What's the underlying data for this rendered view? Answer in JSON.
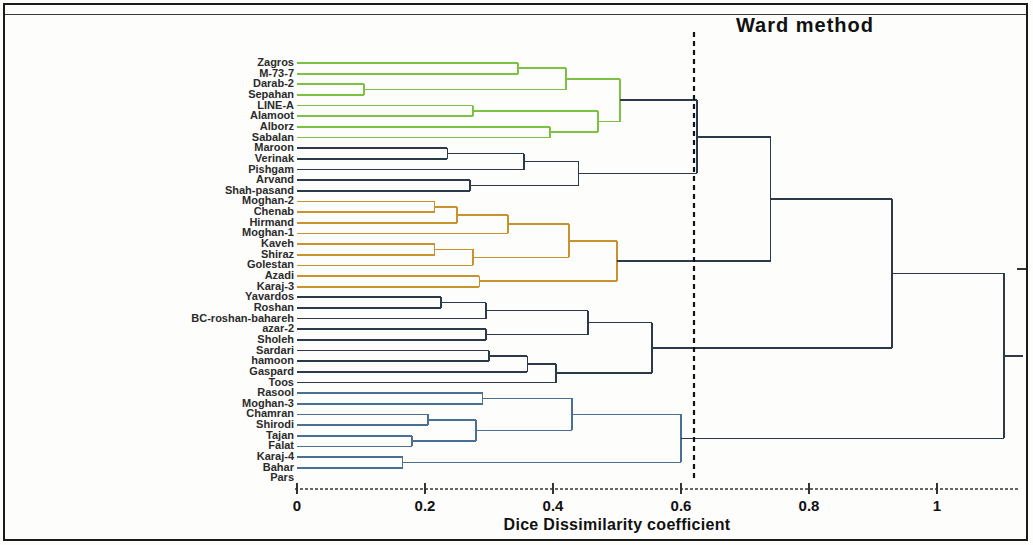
{
  "chart_data": {
    "type": "dendrogram",
    "title": "Ward method",
    "xlabel": "Dice Dissimilarity coefficient",
    "ylabel": "",
    "xlim": [
      0,
      1.15
    ],
    "xticks": [
      0,
      0.2,
      0.4,
      0.6,
      0.8,
      1
    ],
    "xtick_labels": [
      "0",
      "0.2",
      "0.4",
      "0.6",
      "0.8",
      "1"
    ],
    "grid": false,
    "legend": "none",
    "cut_line": {
      "value": 0.615,
      "style": "dashed",
      "color": "#111111"
    },
    "leaf_order": [
      "Zagros",
      "M-73-7",
      "Darab-2",
      "Sepahan",
      "LINE-A",
      "Alamoot",
      "Alborz",
      "Sabalan",
      "Maroon",
      "Verinak",
      "Pishgam",
      "Arvand",
      "Shah-pasand",
      "Moghan-2",
      "Chenab",
      "Hirmand",
      "Moghan-1",
      "Kaveh",
      "Shiraz",
      "Golestan",
      "Azadi",
      "Karaj-3",
      "Yavardos",
      "Roshan",
      "BC-roshan-bahareh",
      "azar-2",
      "Sholeh",
      "Sardari",
      "hamoon",
      "Gaspard",
      "Toos",
      "Rasool",
      "Moghan-3",
      "Chamran",
      "Shirodi",
      "Tajan",
      "Falat",
      "Karaj-4",
      "Bahar",
      "Pars"
    ],
    "cluster_colors": {
      "green": "#7cc144",
      "dark": "#2b3a4a",
      "orange": "#c8922e",
      "blue": "#4a6f94"
    },
    "clusters": [
      {
        "name": "green-cluster",
        "color": "#7cc144",
        "members": [
          "Zagros",
          "M-73-7",
          "Darab-2",
          "Sepahan",
          "LINE-A",
          "Alamoot",
          "Alborz",
          "Sabalan"
        ]
      },
      {
        "name": "dark-cluster-1",
        "color": "#2b3a4a",
        "members": [
          "Maroon",
          "Verinak",
          "Pishgam",
          "Arvand",
          "Shah-pasand"
        ]
      },
      {
        "name": "orange-cluster",
        "color": "#c8922e",
        "members": [
          "Moghan-2",
          "Chenab",
          "Hirmand",
          "Moghan-1",
          "Kaveh",
          "Shiraz",
          "Golestan",
          "Azadi",
          "Karaj-3"
        ]
      },
      {
        "name": "dark-cluster-2",
        "color": "#2b3a4a",
        "members": [
          "Yavardos",
          "Roshan",
          "BC-roshan-bahareh",
          "azar-2",
          "Sholeh",
          "Sardari",
          "hamoon",
          "Gaspard",
          "Toos",
          "Rasool",
          "Moghan-3"
        ]
      },
      {
        "name": "blue-cluster",
        "color": "#4a6f94",
        "members": [
          "Chamran",
          "Shirodi",
          "Tajan",
          "Falat",
          "Karaj-4",
          "Bahar",
          "Pars"
        ]
      }
    ],
    "merges": [
      {
        "height": 0.345,
        "color": "#7cc144",
        "children": [
          "Zagros",
          "M-73-7"
        ]
      },
      {
        "height": 0.105,
        "color": "#7cc144",
        "children": [
          "Darab-2",
          "Sepahan"
        ]
      },
      {
        "height": 0.275,
        "color": "#7cc144",
        "children": [
          "LINE-A",
          "Alamoot"
        ]
      },
      {
        "height": 0.42,
        "color": "#7cc144",
        "children": [
          "Darab-2+Sepahan",
          "Zagros+M-73-7"
        ]
      },
      {
        "height": 0.395,
        "color": "#7cc144",
        "children": [
          "Alborz",
          "Sabalan"
        ]
      },
      {
        "height": 0.47,
        "color": "#7cc144",
        "children": [
          "LINE-A+Alamoot",
          "Alborz+Sabalan"
        ]
      },
      {
        "height": 0.505,
        "color": "#7cc144",
        "children": [
          "green-upper",
          "green-lower"
        ]
      },
      {
        "height": 0.235,
        "color": "#2b3a4a",
        "children": [
          "Maroon",
          "Verinak"
        ]
      },
      {
        "height": 0.355,
        "color": "#2b3a4a",
        "children": [
          "Maroon+Verinak",
          "Pishgam"
        ]
      },
      {
        "height": 0.27,
        "color": "#2b3a4a",
        "children": [
          "Arvand",
          "Shah-pasand"
        ]
      },
      {
        "height": 0.44,
        "color": "#2b3a4a",
        "children": [
          "dark1-upper",
          "dark1-lower"
        ]
      },
      {
        "height": 0.625,
        "color": "#2b3a4a",
        "children": [
          "green-cluster",
          "dark-cluster-1"
        ]
      },
      {
        "height": 0.215,
        "color": "#c8922e",
        "children": [
          "Moghan-2",
          "Chenab"
        ]
      },
      {
        "height": 0.25,
        "color": "#c8922e",
        "children": [
          "Moghan-2+Chenab",
          "Hirmand"
        ]
      },
      {
        "height": 0.33,
        "color": "#c8922e",
        "children": [
          "orange-a",
          "Moghan-1"
        ]
      },
      {
        "height": 0.215,
        "color": "#c8922e",
        "children": [
          "Kaveh",
          "Shiraz"
        ]
      },
      {
        "height": 0.275,
        "color": "#c8922e",
        "children": [
          "Kaveh+Shiraz",
          "Golestan"
        ]
      },
      {
        "height": 0.425,
        "color": "#c8922e",
        "children": [
          "orange-b",
          "orange-c"
        ]
      },
      {
        "height": 0.285,
        "color": "#c8922e",
        "children": [
          "Azadi",
          "Karaj-3"
        ]
      },
      {
        "height": 0.5,
        "color": "#c8922e",
        "children": [
          "orange-d",
          "Azadi+Karaj-3"
        ]
      },
      {
        "height": 0.74,
        "color": "#2b3a4a",
        "children": [
          "green+dark1",
          "orange-cluster"
        ]
      },
      {
        "height": 0.225,
        "color": "#2b3a4a",
        "children": [
          "Yavardos",
          "Roshan"
        ]
      },
      {
        "height": 0.295,
        "color": "#2b3a4a",
        "children": [
          "Yavardos+Roshan",
          "BC-roshan-bahareh"
        ]
      },
      {
        "height": 0.295,
        "color": "#2b3a4a",
        "children": [
          "azar-2",
          "Sholeh"
        ]
      },
      {
        "height": 0.455,
        "color": "#2b3a4a",
        "children": [
          "dark2-a",
          "dark2-b"
        ]
      },
      {
        "height": 0.3,
        "color": "#2b3a4a",
        "children": [
          "Sardari",
          "hamoon"
        ]
      },
      {
        "height": 0.36,
        "color": "#2b3a4a",
        "children": [
          "Sardari+hamoon",
          "Gaspard"
        ]
      },
      {
        "height": 0.405,
        "color": "#2b3a4a",
        "children": [
          "dark2-c",
          "Toos"
        ]
      },
      {
        "height": 0.555,
        "color": "#2b3a4a",
        "children": [
          "dark2-upper",
          "dark2-lower"
        ]
      },
      {
        "height": 0.93,
        "color": "#2b3a4a",
        "children": [
          "top-left",
          "dark-cluster-2"
        ]
      },
      {
        "height": 0.29,
        "color": "#4a6f94",
        "children": [
          "Rasool",
          "Moghan-3"
        ]
      },
      {
        "height": 0.205,
        "color": "#4a6f94",
        "children": [
          "Chamran",
          "Shirodi"
        ]
      },
      {
        "height": 0.18,
        "color": "#4a6f94",
        "children": [
          "Tajan",
          "Falat"
        ]
      },
      {
        "height": 0.28,
        "color": "#4a6f94",
        "children": [
          "blue-b",
          "blue-c"
        ]
      },
      {
        "height": 0.43,
        "color": "#4a6f94",
        "children": [
          "blue-a",
          "blue-d"
        ]
      },
      {
        "height": 0.165,
        "color": "#4a6f94",
        "children": [
          "Karaj-4",
          "Bahar"
        ]
      },
      {
        "height": 0.6,
        "color": "#4a6f94",
        "children": [
          "blue-e",
          "blue-f"
        ]
      },
      {
        "height": 1.105,
        "color": "#2b3a4a",
        "children": [
          "all-upper",
          "blue-cluster"
        ]
      }
    ]
  },
  "axis": {
    "ticks": [
      {
        "label": "0",
        "value": 0
      },
      {
        "label": "0.2",
        "value": 0.2
      },
      {
        "label": "0.4",
        "value": 0.4
      },
      {
        "label": "0.6",
        "value": 0.6
      },
      {
        "label": "0.8",
        "value": 0.8
      },
      {
        "label": "1",
        "value": 1
      }
    ]
  },
  "labels": {
    "l0": "Zagros",
    "l1": "M-73-7",
    "l2": "Darab-2",
    "l3": "Sepahan",
    "l4": "LINE-A",
    "l5": "Alamoot",
    "l6": "Alborz",
    "l7": "Sabalan",
    "l8": "Maroon",
    "l9": "Verinak",
    "l10": "Pishgam",
    "l11": "Arvand",
    "l12": "Shah-pasand",
    "l13": "Moghan-2",
    "l14": "Chenab",
    "l15": "Hirmand",
    "l16": "Moghan-1",
    "l17": "Kaveh",
    "l18": "Shiraz",
    "l19": "Golestan",
    "l20": "Azadi",
    "l21": "Karaj-3",
    "l22": "Yavardos",
    "l23": "Roshan",
    "l24": "BC-roshan-bahareh",
    "l25": "azar-2",
    "l26": "Sholeh",
    "l27": "Sardari",
    "l28": "hamoon",
    "l29": "Gaspard",
    "l30": "Toos",
    "l31": "Rasool",
    "l32": "Moghan-3",
    "l33": "Chamran",
    "l34": "Shirodi",
    "l35": "Tajan",
    "l36": "Falat",
    "l37": "Karaj-4",
    "l38": "Bahar",
    "l39": "Pars"
  },
  "header": {
    "title": "Ward method"
  },
  "footer": {
    "xaxis_title": "Dice Dissimilarity coefficient"
  }
}
